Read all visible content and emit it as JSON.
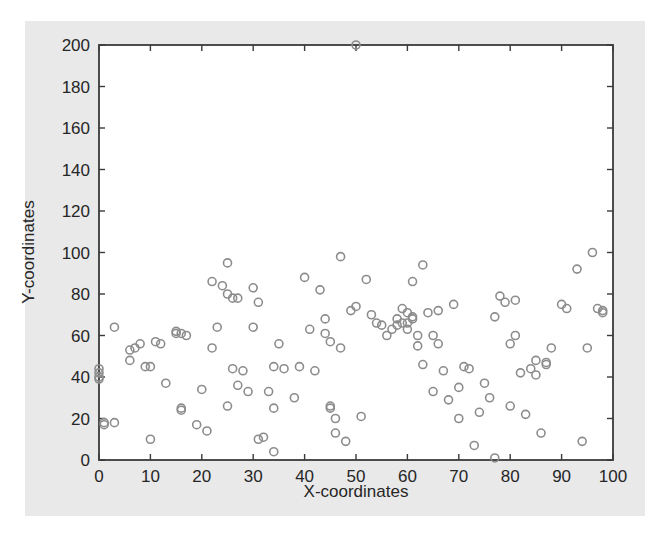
{
  "figure": {
    "background_color": "#e9e9e9",
    "page_background_color": "#ffffff",
    "axes_background_color": "#ffffff",
    "axis_color": "#3a3a3a",
    "marker_color": "#8c8c8c",
    "text_color": "#262626"
  },
  "chart_data": {
    "type": "scatter",
    "title": "",
    "xlabel": "X-coordinates",
    "ylabel": "Y-coordinates",
    "xlim": [
      0,
      100
    ],
    "ylim": [
      0,
      200
    ],
    "xticks": [
      0,
      10,
      20,
      30,
      40,
      50,
      60,
      70,
      80,
      90,
      100
    ],
    "yticks": [
      0,
      20,
      40,
      60,
      80,
      100,
      120,
      140,
      160,
      180,
      200
    ],
    "xticklabels": [
      "0",
      "10",
      "20",
      "30",
      "40",
      "50",
      "60",
      "70",
      "80",
      "90",
      "100"
    ],
    "yticklabels": [
      "0",
      "20",
      "40",
      "60",
      "80",
      "100",
      "120",
      "140",
      "160",
      "180",
      "200"
    ],
    "grid": false,
    "legend": null,
    "marker": "circle-open",
    "marker_size": 6,
    "series": [
      {
        "name": "coordinates",
        "x": [
          0,
          0,
          0,
          0,
          1,
          1,
          3,
          3,
          6,
          6,
          7,
          8,
          9,
          10,
          10,
          11,
          12,
          13,
          15,
          15,
          16,
          16,
          16,
          17,
          19,
          20,
          21,
          22,
          22,
          23,
          24,
          25,
          25,
          25,
          26,
          26,
          27,
          27,
          28,
          29,
          30,
          30,
          31,
          31,
          32,
          33,
          34,
          34,
          34,
          35,
          36,
          38,
          39,
          40,
          41,
          42,
          43,
          44,
          44,
          45,
          45,
          45,
          46,
          46,
          47,
          47,
          48,
          49,
          50,
          50,
          51,
          52,
          53,
          54,
          55,
          56,
          57,
          58,
          58,
          59,
          59,
          60,
          60,
          60,
          61,
          61,
          61,
          62,
          62,
          63,
          63,
          64,
          65,
          65,
          66,
          66,
          67,
          68,
          69,
          70,
          70,
          71,
          72,
          73,
          74,
          75,
          76,
          77,
          77,
          78,
          79,
          80,
          80,
          81,
          81,
          82,
          83,
          84,
          85,
          85,
          86,
          87,
          87,
          88,
          90,
          91,
          93,
          94,
          95,
          96,
          97,
          98,
          98
        ],
        "y": [
          44,
          42,
          40,
          39,
          18,
          17,
          64,
          18,
          53,
          48,
          54,
          56,
          45,
          10,
          45,
          57,
          56,
          37,
          62,
          61,
          24,
          25,
          61,
          60,
          17,
          34,
          14,
          54,
          86,
          64,
          84,
          95,
          80,
          26,
          78,
          44,
          78,
          36,
          43,
          33,
          83,
          64,
          76,
          10,
          11,
          33,
          4,
          45,
          25,
          56,
          44,
          30,
          45,
          88,
          63,
          43,
          82,
          68,
          61,
          57,
          26,
          25,
          20,
          13,
          54,
          98,
          9,
          72,
          200,
          74,
          21,
          87,
          70,
          66,
          65,
          60,
          63,
          68,
          65,
          73,
          66,
          66,
          71,
          63,
          86,
          69,
          68,
          60,
          55,
          94,
          46,
          71,
          60,
          33,
          72,
          56,
          43,
          29,
          75,
          35,
          20,
          45,
          44,
          7,
          23,
          37,
          30,
          1,
          69,
          79,
          76,
          56,
          26,
          77,
          60,
          42,
          22,
          44,
          48,
          41,
          13,
          47,
          46,
          54,
          75,
          73,
          92,
          9,
          54,
          100,
          73,
          71,
          72
        ]
      }
    ]
  }
}
